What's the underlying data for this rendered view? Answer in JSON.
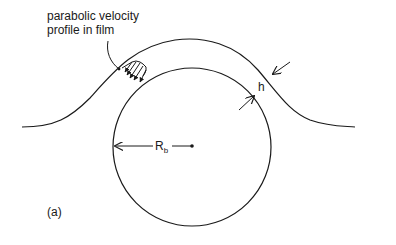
{
  "diagram": {
    "annotation": {
      "line1": "parabolic velocity",
      "line2": "profile in film"
    },
    "thickness_label": "h",
    "radius_label": {
      "main": "R",
      "subscript": "b"
    },
    "panel_label": "(a)",
    "colors": {
      "ink": "#1a1a1a",
      "background": "#ffffff"
    }
  }
}
